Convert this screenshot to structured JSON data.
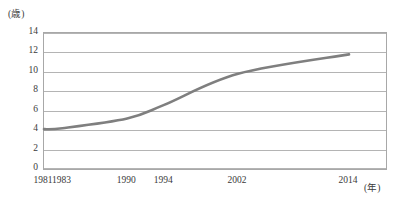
{
  "chart_data": {
    "type": "line",
    "title": "",
    "subtitle": "",
    "xlabel": "(年)",
    "ylabel": "(歳)",
    "x": [
      1981,
      1983,
      1990,
      1994,
      2002,
      2014
    ],
    "categories": [
      "1981",
      "1983",
      "1990",
      "1994",
      "2002",
      "2014"
    ],
    "series": [
      {
        "name": "",
        "values": [
          4.1,
          4.2,
          5.2,
          6.6,
          9.8,
          11.8
        ]
      }
    ],
    "values": [
      4.1,
      4.2,
      5.2,
      6.6,
      9.8,
      11.8
    ],
    "xlim": [
      1981,
      2018
    ],
    "ylim": [
      0,
      14
    ],
    "ytick_labels": [
      "14",
      "12",
      "10",
      "8",
      "6",
      "4",
      "2",
      "0"
    ],
    "ytick_values": [
      14,
      12,
      10,
      8,
      6,
      4,
      2,
      0
    ],
    "xtick_labels": [
      "1981",
      "1983",
      "1990",
      "1994",
      "2002",
      "2014"
    ],
    "xtick_values": [
      1981,
      1983,
      1990,
      1994,
      2002,
      2014
    ],
    "grid": "horizontal",
    "legend": "none",
    "line_color": "#7f7f7f",
    "grid_color": "#b4b4b4",
    "axis_color": "#a8a8a8",
    "text_color": "#3a3a3a",
    "annotations": []
  },
  "axes": {
    "y_unit_label": "(歳)",
    "x_unit_label": "(年)"
  }
}
